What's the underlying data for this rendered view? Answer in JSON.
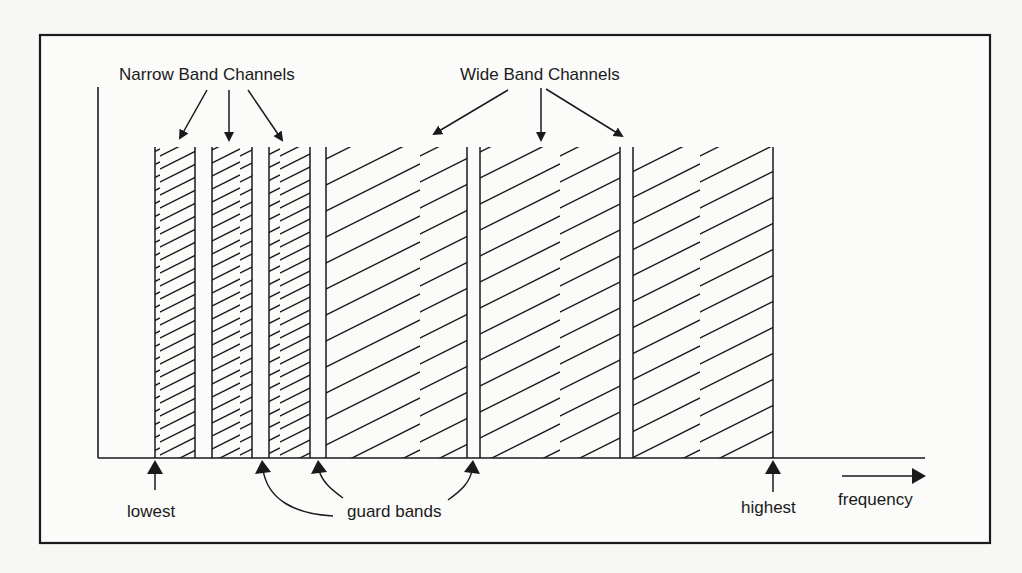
{
  "diagram": {
    "type": "frequency-division spectrum diagram",
    "labels": {
      "narrow_band": "Narrow Band Channels",
      "wide_band": "Wide Band Channels",
      "lowest": "lowest",
      "highest": "highest",
      "guard_bands": "guard bands",
      "frequency": "frequency"
    },
    "axis": {
      "x_label": "frequency",
      "direction": "increasing to the right"
    },
    "channels": [
      {
        "group": "narrow",
        "index": 1,
        "x_start": 155,
        "x_end": 195
      },
      {
        "group": "narrow",
        "index": 2,
        "x_start": 212,
        "x_end": 252
      },
      {
        "group": "narrow",
        "index": 3,
        "x_start": 269,
        "x_end": 310
      },
      {
        "group": "wide",
        "index": 1,
        "x_start": 326,
        "x_end": 467
      },
      {
        "group": "wide",
        "index": 2,
        "x_start": 480,
        "x_end": 620
      },
      {
        "group": "wide",
        "index": 3,
        "x_start": 633,
        "x_end": 773
      }
    ],
    "guard_band_markers": 3,
    "colors": {
      "ink": "#1a1a1a",
      "paper": "#f7f7f5"
    }
  }
}
